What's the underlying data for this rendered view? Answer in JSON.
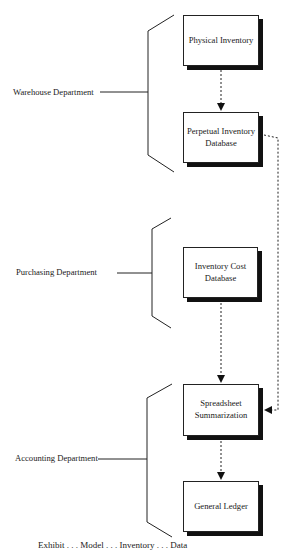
{
  "diagram": {
    "departments": [
      {
        "id": "warehouse",
        "label": "Warehouse Department"
      },
      {
        "id": "purchasing",
        "label": "Purchasing Department"
      },
      {
        "id": "accounting",
        "label": "Accounting Department"
      }
    ],
    "nodes": [
      {
        "id": "physical-inventory",
        "label": "Physical Inventory",
        "department": "warehouse"
      },
      {
        "id": "perpetual-inventory-database",
        "label": "Perpetual Inventory\nDatabase",
        "department": "warehouse"
      },
      {
        "id": "inventory-cost-database",
        "label": "Inventory Cost\nDatabase",
        "department": "purchasing"
      },
      {
        "id": "spreadsheet-summarization",
        "label": "Spreadsheet\nSummarization",
        "department": "accounting"
      },
      {
        "id": "general-ledger",
        "label": "General Ledger",
        "department": "accounting"
      }
    ],
    "edges": [
      {
        "from": "physical-inventory",
        "to": "perpetual-inventory-database",
        "style": "dashed"
      },
      {
        "from": "perpetual-inventory-database",
        "to": "spreadsheet-summarization",
        "style": "dashed"
      },
      {
        "from": "inventory-cost-database",
        "to": "spreadsheet-summarization",
        "style": "dashed"
      },
      {
        "from": "spreadsheet-summarization",
        "to": "general-ledger",
        "style": "dashed"
      }
    ],
    "caption": "Exhibit . . . Model . . . Inventory . . . Data"
  }
}
